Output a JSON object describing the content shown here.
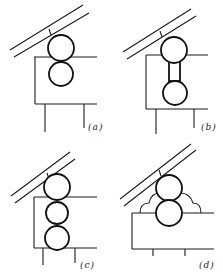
{
  "figure": {
    "panels": [
      {
        "id": "a",
        "label": "(a)",
        "description": "two tangent circles under sloped double line, rectangular frame with two legs"
      },
      {
        "id": "b",
        "label": "(b)",
        "description": "two circles joined by a short neck under sloped double line, frame with two legs"
      },
      {
        "id": "c",
        "label": "(c)",
        "description": "three stacked circles under sloped double line, frame with two legs"
      },
      {
        "id": "d",
        "label": "(d)",
        "description": "two stacked circles with scalloped side fillets on a rectangular block with two short legs"
      }
    ],
    "colors": {
      "line": "#1a1a1a",
      "background": "#ffffff"
    }
  }
}
